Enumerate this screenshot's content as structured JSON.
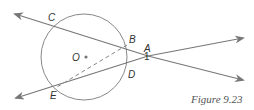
{
  "figure": {
    "caption": "Figure 9.23",
    "points": {
      "C": "C",
      "B": "B",
      "A": "A",
      "D": "D",
      "E": "E",
      "O": "O"
    },
    "angle_label": "1",
    "colors": {
      "line": "#777777",
      "text": "#333333",
      "caption": "#555555"
    }
  }
}
